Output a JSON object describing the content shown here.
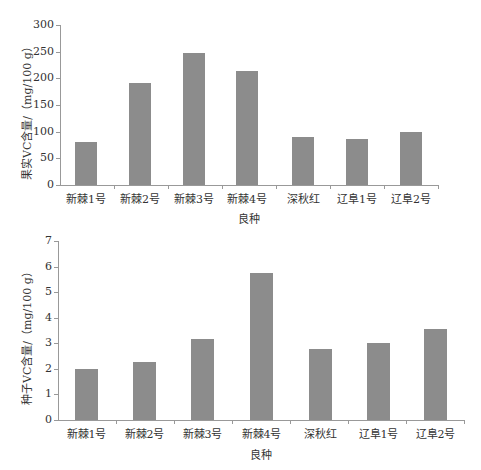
{
  "chart_data": [
    {
      "type": "bar",
      "title": "",
      "xlabel": "良种",
      "ylabel": "果实VC含量/（mg/100 g）",
      "categories": [
        "新棘1号",
        "新棘2号",
        "新棘3号",
        "新棘4号",
        "深秋红",
        "辽阜1号",
        "辽阜2号"
      ],
      "values": [
        81,
        191,
        248,
        213,
        90,
        86,
        99
      ],
      "ylim": [
        0,
        300
      ],
      "yticks": [
        0,
        50,
        100,
        150,
        200,
        250,
        300
      ],
      "grid": false,
      "bar_color": "#8c8c8c"
    },
    {
      "type": "bar",
      "title": "",
      "xlabel": "良种",
      "ylabel": "种子VC含量/（mg/100 g）",
      "categories": [
        "新棘1号",
        "新棘2号",
        "新棘3号",
        "新棘4号",
        "深秋红",
        "辽阜1号",
        "辽阜2号"
      ],
      "values": [
        1.98,
        2.26,
        3.16,
        5.76,
        2.76,
        3.0,
        3.56
      ],
      "ylim": [
        0,
        7
      ],
      "yticks": [
        0,
        1,
        2,
        3,
        4,
        5,
        6,
        7
      ],
      "grid": false,
      "bar_color": "#8c8c8c"
    }
  ]
}
